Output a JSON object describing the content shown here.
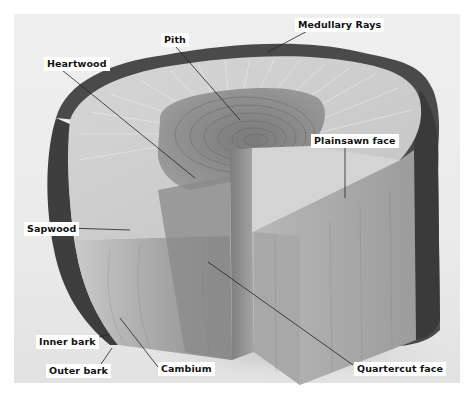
{
  "diagram": {
    "colors": {
      "background": "#ffffff",
      "photo_bg": "#ececec",
      "bark": "#4a4a4a",
      "sapwood": "#cfcfcf",
      "heartwood": "#8d8d8d",
      "face_light": "#bdbdbd",
      "face_dark": "#8a8a8a",
      "leader_line": "#222222",
      "label_bg": "#ffffff",
      "label_text": "#111111"
    },
    "labels": [
      {
        "id": "medullary-rays",
        "text": "Medullary Rays"
      },
      {
        "id": "pith",
        "text": "Pith"
      },
      {
        "id": "heartwood",
        "text": "Heartwood"
      },
      {
        "id": "plainsawn-face",
        "text": "Plainsawn face"
      },
      {
        "id": "sapwood",
        "text": "Sapwood"
      },
      {
        "id": "inner-bark",
        "text": "Inner bark"
      },
      {
        "id": "outer-bark",
        "text": "Outer bark"
      },
      {
        "id": "cambium",
        "text": "Cambium"
      },
      {
        "id": "quartercut-face",
        "text": "Quartercut face"
      }
    ]
  }
}
